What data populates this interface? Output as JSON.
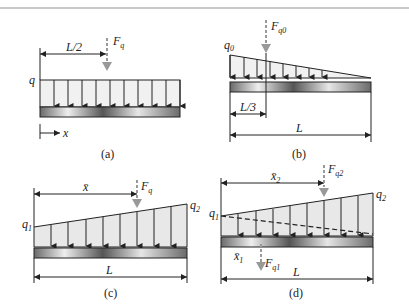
{
  "figure": {
    "panels": [
      {
        "id": "a",
        "caption": "(a)",
        "load": "uniform",
        "labels": {
          "intensity": "q",
          "force": "F",
          "force_sub": "q",
          "dimension": "L/2",
          "axis": "x"
        }
      },
      {
        "id": "b",
        "caption": "(b)",
        "load": "triangular",
        "labels": {
          "intensity": "q",
          "intensity_sub": "0",
          "force": "F",
          "force_sub": "q0",
          "dimension_short": "L/3",
          "dimension_long": "L"
        }
      },
      {
        "id": "c",
        "caption": "(c)",
        "load": "trapezoidal",
        "labels": {
          "intensity_left": "q",
          "intensity_left_sub": "1",
          "intensity_right": "q",
          "intensity_right_sub": "2",
          "force": "F",
          "force_sub": "q",
          "dimension_centroid": "x̄",
          "dimension_long": "L"
        }
      },
      {
        "id": "d",
        "caption": "(d)",
        "load": "trapezoidal-decomposed",
        "labels": {
          "intensity_left": "q",
          "intensity_left_sub": "1",
          "intensity_right": "q",
          "intensity_right_sub": "2",
          "force1": "F",
          "force1_sub": "q1",
          "force2": "F",
          "force2_sub": "q2",
          "dimension_x1": "x̄",
          "dimension_x1_sub": "1",
          "dimension_x2": "x̄",
          "dimension_x2_sub": "2",
          "dimension_long": "L"
        }
      }
    ],
    "colors": {
      "load_fill": "#ececec",
      "beam_dark": "#555555",
      "beam_light": "#e8e8e8",
      "force_arrow": "#999999",
      "line": "#222222",
      "rule": "#c9c9c9"
    }
  }
}
